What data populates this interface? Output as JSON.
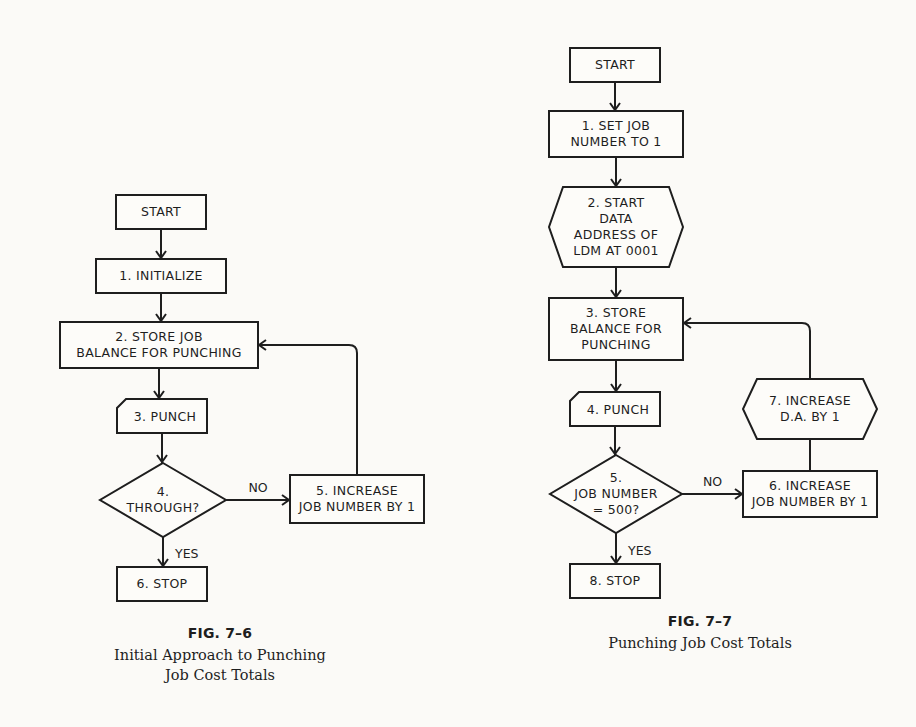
{
  "figures": [
    {
      "id": "fig-7-6",
      "number": "FIG. 7–6",
      "title_lines": [
        "Initial Approach to Punching",
        "Job Cost Totals"
      ],
      "nodes": [
        {
          "id": "start",
          "shape": "rect",
          "lines": [
            "START"
          ],
          "x": 116,
          "y": 195,
          "w": 90,
          "h": 34
        },
        {
          "id": "n1",
          "shape": "rect",
          "lines": [
            "1.  INITIALIZE"
          ],
          "x": 96,
          "y": 259,
          "w": 130,
          "h": 34
        },
        {
          "id": "n2",
          "shape": "rect",
          "lines": [
            "2.  STORE JOB",
            "BALANCE FOR PUNCHING"
          ],
          "x": 60,
          "y": 322,
          "w": 198,
          "h": 46
        },
        {
          "id": "n3",
          "shape": "card",
          "lines": [
            "3.  PUNCH"
          ],
          "x": 117,
          "y": 399,
          "w": 90,
          "h": 34
        },
        {
          "id": "n4",
          "shape": "diamond",
          "lines": [
            "4.",
            "THROUGH?"
          ],
          "x": 100,
          "y": 463,
          "w": 126,
          "h": 74
        },
        {
          "id": "n5",
          "shape": "rect",
          "lines": [
            "5.  INCREASE",
            "JOB NUMBER BY 1"
          ],
          "x": 290,
          "y": 475,
          "w": 134,
          "h": 48
        },
        {
          "id": "n6",
          "shape": "rect",
          "lines": [
            "6.  STOP"
          ],
          "x": 117,
          "y": 567,
          "w": 90,
          "h": 34
        }
      ],
      "edges": [
        {
          "from": "start",
          "to": "n1",
          "label": ""
        },
        {
          "from": "n1",
          "to": "n2",
          "label": ""
        },
        {
          "from": "n2",
          "to": "n3",
          "label": ""
        },
        {
          "from": "n3",
          "to": "n4",
          "label": ""
        },
        {
          "from": "n4",
          "to": "n5",
          "label": "NO"
        },
        {
          "from": "n4",
          "to": "n6",
          "label": "YES"
        },
        {
          "from": "n5",
          "to": "n2",
          "label": "",
          "type": "loop"
        }
      ]
    },
    {
      "id": "fig-7-7",
      "number": "FIG. 7–7",
      "title_lines": [
        "Punching Job Cost Totals"
      ],
      "nodes": [
        {
          "id": "start",
          "shape": "rect",
          "lines": [
            "START"
          ],
          "x": 570,
          "y": 48,
          "w": 90,
          "h": 34
        },
        {
          "id": "n1",
          "shape": "rect",
          "lines": [
            "1.  SET JOB",
            "NUMBER TO 1"
          ],
          "x": 549,
          "y": 111,
          "w": 134,
          "h": 46
        },
        {
          "id": "n2",
          "shape": "hexagon",
          "lines": [
            "2.  START",
            "DATA",
            "ADDRESS OF",
            "LDM AT 0001"
          ],
          "x": 549,
          "y": 187,
          "w": 134,
          "h": 80
        },
        {
          "id": "n3",
          "shape": "rect",
          "lines": [
            "3.  STORE",
            "BALANCE FOR",
            "PUNCHING"
          ],
          "x": 549,
          "y": 298,
          "w": 134,
          "h": 62
        },
        {
          "id": "n4",
          "shape": "card",
          "lines": [
            "4.  PUNCH"
          ],
          "x": 570,
          "y": 392,
          "w": 90,
          "h": 34
        },
        {
          "id": "n5",
          "shape": "diamond",
          "lines": [
            "5.",
            "JOB NUMBER",
            "= 500?"
          ],
          "x": 550,
          "y": 455,
          "w": 132,
          "h": 78
        },
        {
          "id": "n6",
          "shape": "rect",
          "lines": [
            "6.  INCREASE",
            "JOB NUMBER BY 1"
          ],
          "x": 743,
          "y": 471,
          "w": 134,
          "h": 46
        },
        {
          "id": "n7",
          "shape": "hexagon",
          "lines": [
            "7.  INCREASE",
            "D.A. BY 1"
          ],
          "x": 743,
          "y": 379,
          "w": 134,
          "h": 60
        },
        {
          "id": "n8",
          "shape": "rect",
          "lines": [
            "8.  STOP"
          ],
          "x": 570,
          "y": 564,
          "w": 90,
          "h": 34
        }
      ],
      "edges": [
        {
          "from": "start",
          "to": "n1",
          "label": ""
        },
        {
          "from": "n1",
          "to": "n2",
          "label": ""
        },
        {
          "from": "n2",
          "to": "n3",
          "label": ""
        },
        {
          "from": "n3",
          "to": "n4",
          "label": ""
        },
        {
          "from": "n4",
          "to": "n5",
          "label": ""
        },
        {
          "from": "n5",
          "to": "n6",
          "label": "NO"
        },
        {
          "from": "n5",
          "to": "n8",
          "label": "YES"
        },
        {
          "from": "n6",
          "to": "n7",
          "label": "",
          "type": "up"
        },
        {
          "from": "n7",
          "to": "n3",
          "label": "",
          "type": "loop"
        }
      ]
    }
  ],
  "captions": {
    "fig_7_6": {
      "number": "FIG. 7–6",
      "line1": "Initial Approach to Punching",
      "line2": "Job Cost Totals"
    },
    "fig_7_7": {
      "number": "FIG. 7–7",
      "line1": "Punching Job Cost Totals"
    }
  }
}
